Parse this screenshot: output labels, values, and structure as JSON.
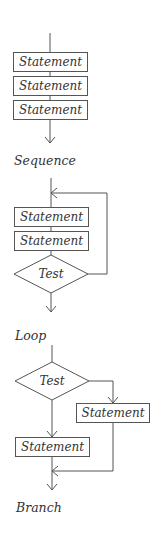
{
  "diagrams": {
    "sequence": {
      "caption": "Sequence",
      "statements": [
        "Statement",
        "Statement",
        "Statement"
      ]
    },
    "loop": {
      "caption": "Loop",
      "statements": [
        "Statement",
        "Statement"
      ],
      "test": "Test"
    },
    "branch": {
      "caption": "Branch",
      "test": "Test",
      "statements": [
        "Statement",
        "Statement"
      ]
    }
  },
  "colors": {
    "line": "#555555",
    "text": "#333333",
    "background": "#ffffff"
  }
}
